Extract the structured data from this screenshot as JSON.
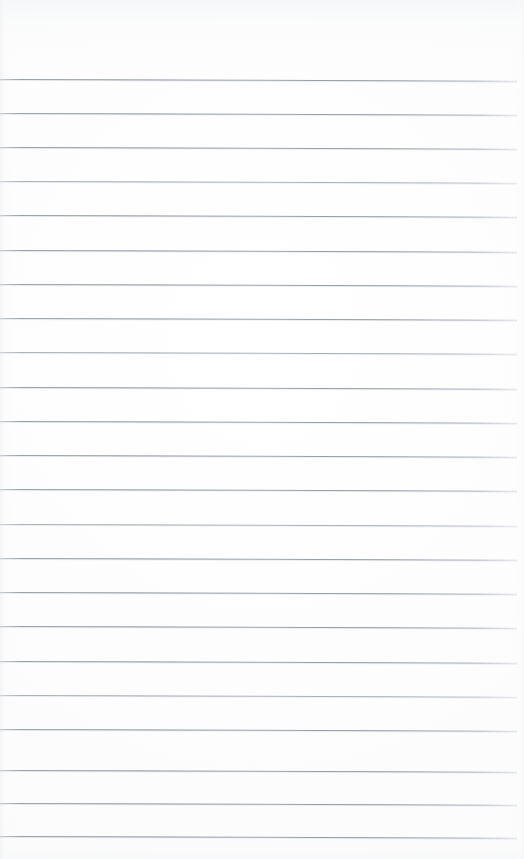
{
  "document": {
    "type": "scanned-ruled-notepad-page",
    "title": "Blank Ruled Notepad Page",
    "orientation": "portrait",
    "page_width": 524,
    "page_height": 859,
    "content_text": "",
    "is_blank": true,
    "handwriting_present": false,
    "printed_text_present": false
  },
  "paper": {
    "background_color": "#fdfdfd",
    "edge_tint_color": "#f4f5f7",
    "texture": "faint-scan-mottling",
    "left_margin_rule": false,
    "right_margin_rule": false,
    "holes_present": false,
    "header_blank_height": 79,
    "footer_blank_height": 22
  },
  "ruling": {
    "style": "horizontal-ruled",
    "line_color": "#8a919d",
    "line_thickness": 1,
    "line_spacing": 34.4,
    "first_line_y": 79,
    "last_line_y": 836,
    "line_start_x": 0,
    "line_end_x": 517,
    "skew_degrees": 0.19,
    "line_count": 23,
    "line_y_positions": [
      79,
      113,
      147,
      181,
      215,
      250,
      284,
      318,
      352,
      387,
      421,
      455,
      489,
      524,
      558,
      592,
      626,
      661,
      695,
      729,
      770,
      803,
      836
    ]
  },
  "accessibility": {
    "page_label": "Blank lined paper page",
    "line_label": "ruled line"
  }
}
